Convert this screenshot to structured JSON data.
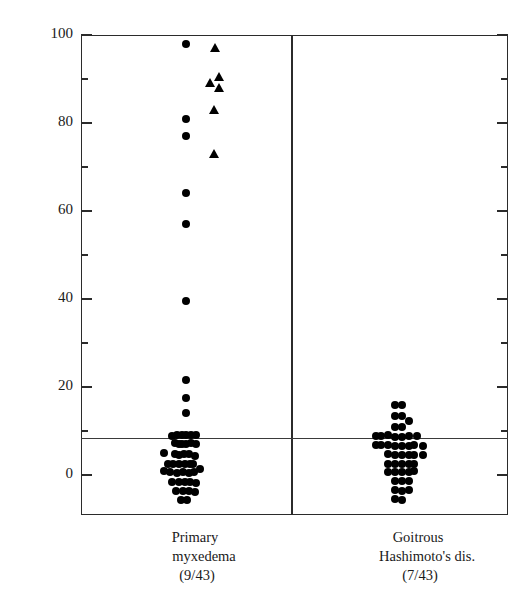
{
  "chart_data": {
    "type": "scatter",
    "title": "",
    "xlabel": "",
    "ylabel_parts": {
      "pre": "Inhibition of ",
      "sup": "125",
      "post": "I-TSH binding(%)"
    },
    "ylabel": "Inhibition of 125I-TSH binding(%)",
    "ylim": [
      -10,
      100
    ],
    "yticks_major": [
      0,
      20,
      40,
      60,
      80,
      100
    ],
    "yticks_minor": [
      10,
      30,
      50,
      70,
      90
    ],
    "ytick_labels": [
      "0",
      "20",
      "40",
      "60",
      "80",
      "100"
    ],
    "grid": false,
    "legend": "none",
    "cutoff_value": 8.5,
    "cutoff_note": "horizontal reference line near 8.5%",
    "groups": [
      {
        "name": "Primary myxedema",
        "caption_line1": "Primary",
        "caption_line2": "myxedema",
        "caption_line3": "(9/43)",
        "positive_fraction": "9/43",
        "series": [
          {
            "marker": "circle",
            "name": "primary-myxedema-circles",
            "points": [
              {
                "x": 0.0,
                "y": 98.0
              },
              {
                "x": 0.0,
                "y": 81.0
              },
              {
                "x": 0.0,
                "y": 77.0
              },
              {
                "x": 0.0,
                "y": 64.0
              },
              {
                "x": 0.0,
                "y": 57.0
              },
              {
                "x": 0.0,
                "y": 39.5
              },
              {
                "x": 0.0,
                "y": 21.5
              },
              {
                "x": 0.0,
                "y": 17.5
              },
              {
                "x": 0.0,
                "y": 14.0
              },
              {
                "x": -0.4,
                "y": 9.0
              },
              {
                "x": -0.62,
                "y": 8.8
              },
              {
                "x": -0.18,
                "y": 9.0
              },
              {
                "x": 0.0,
                "y": 9.2
              },
              {
                "x": 0.22,
                "y": 9.0
              },
              {
                "x": 0.46,
                "y": 9.0
              },
              {
                "x": -0.5,
                "y": 7.2
              },
              {
                "x": -0.3,
                "y": 7.0
              },
              {
                "x": -0.18,
                "y": 7.0
              },
              {
                "x": 0.0,
                "y": 7.0
              },
              {
                "x": 0.22,
                "y": 7.2
              },
              {
                "x": 0.46,
                "y": 7.0
              },
              {
                "x": -0.98,
                "y": 5.0
              },
              {
                "x": -0.52,
                "y": 4.8
              },
              {
                "x": -0.3,
                "y": 4.6
              },
              {
                "x": -0.1,
                "y": 4.8
              },
              {
                "x": 0.13,
                "y": 4.8
              },
              {
                "x": 0.4,
                "y": 4.4
              },
              {
                "x": -0.8,
                "y": 2.5
              },
              {
                "x": -0.58,
                "y": 2.6
              },
              {
                "x": -0.3,
                "y": 2.4
              },
              {
                "x": -0.06,
                "y": 2.5
              },
              {
                "x": 0.18,
                "y": 2.4
              },
              {
                "x": 0.34,
                "y": 2.4
              },
              {
                "x": -0.98,
                "y": 0.8
              },
              {
                "x": -0.72,
                "y": 0.6
              },
              {
                "x": -0.4,
                "y": 0.5
              },
              {
                "x": -0.14,
                "y": 0.6
              },
              {
                "x": 0.12,
                "y": 0.5
              },
              {
                "x": 0.38,
                "y": 0.6
              },
              {
                "x": 0.62,
                "y": 1.4
              },
              {
                "x": -0.62,
                "y": -1.6
              },
              {
                "x": -0.3,
                "y": -1.6
              },
              {
                "x": -0.06,
                "y": -1.6
              },
              {
                "x": 0.18,
                "y": -1.6
              },
              {
                "x": 0.44,
                "y": -1.8
              },
              {
                "x": -0.44,
                "y": -3.6
              },
              {
                "x": -0.12,
                "y": -3.6
              },
              {
                "x": 0.14,
                "y": -3.6
              },
              {
                "x": 0.4,
                "y": -3.8
              },
              {
                "x": -0.22,
                "y": -5.6
              },
              {
                "x": 0.06,
                "y": -5.6
              }
            ]
          },
          {
            "marker": "triangle",
            "name": "primary-myxedema-triangles",
            "points": [
              {
                "x": 1.3,
                "y": 97.0
              },
              {
                "x": 1.52,
                "y": 90.5
              },
              {
                "x": 1.08,
                "y": 89.0
              },
              {
                "x": 1.5,
                "y": 88.0
              },
              {
                "x": 1.28,
                "y": 83.0
              },
              {
                "x": 1.26,
                "y": 73.0
              }
            ]
          }
        ]
      },
      {
        "name": "Goitrous Hashimoto's dis.",
        "caption_line1": "Goitrous",
        "caption_line2": "Hashimoto's dis.",
        "caption_line3": "(7/43)",
        "positive_fraction": "7/43",
        "series": [
          {
            "marker": "circle",
            "name": "goitrous-hashimoto-circles",
            "points": [
              {
                "x": -0.12,
                "y": 16.0
              },
              {
                "x": 0.18,
                "y": 16.0
              },
              {
                "x": -0.12,
                "y": 13.4
              },
              {
                "x": 0.18,
                "y": 13.4
              },
              {
                "x": 0.48,
                "y": 12.2
              },
              {
                "x": -0.12,
                "y": 10.8
              },
              {
                "x": 0.18,
                "y": 10.8
              },
              {
                "x": -1.02,
                "y": 8.8
              },
              {
                "x": -0.78,
                "y": 8.8
              },
              {
                "x": -0.44,
                "y": 9.0
              },
              {
                "x": -0.12,
                "y": 8.6
              },
              {
                "x": 0.18,
                "y": 8.6
              },
              {
                "x": 0.48,
                "y": 8.8
              },
              {
                "x": 0.86,
                "y": 8.8
              },
              {
                "x": -1.02,
                "y": 6.8
              },
              {
                "x": -0.78,
                "y": 6.8
              },
              {
                "x": -0.44,
                "y": 6.8
              },
              {
                "x": -0.12,
                "y": 6.6
              },
              {
                "x": 0.18,
                "y": 6.6
              },
              {
                "x": 0.48,
                "y": 6.6
              },
              {
                "x": 0.72,
                "y": 6.8
              },
              {
                "x": 1.12,
                "y": 6.6
              },
              {
                "x": -0.44,
                "y": 4.8
              },
              {
                "x": -0.12,
                "y": 4.6
              },
              {
                "x": 0.18,
                "y": 4.6
              },
              {
                "x": 0.48,
                "y": 4.6
              },
              {
                "x": 0.72,
                "y": 4.6
              },
              {
                "x": 1.12,
                "y": 4.6
              },
              {
                "x": -0.44,
                "y": 2.6
              },
              {
                "x": -0.12,
                "y": 2.6
              },
              {
                "x": 0.18,
                "y": 2.6
              },
              {
                "x": 0.48,
                "y": 2.6
              },
              {
                "x": 0.72,
                "y": 2.6
              },
              {
                "x": -0.44,
                "y": 0.6
              },
              {
                "x": -0.12,
                "y": 0.6
              },
              {
                "x": 0.18,
                "y": 0.6
              },
              {
                "x": 0.48,
                "y": 0.6
              },
              {
                "x": 0.72,
                "y": 0.8
              },
              {
                "x": -0.12,
                "y": -1.4
              },
              {
                "x": 0.18,
                "y": -1.4
              },
              {
                "x": 0.48,
                "y": -1.4
              },
              {
                "x": -0.12,
                "y": -3.4
              },
              {
                "x": 0.18,
                "y": -3.6
              },
              {
                "x": 0.48,
                "y": -3.4
              },
              {
                "x": -0.12,
                "y": -5.4
              },
              {
                "x": 0.18,
                "y": -5.6
              }
            ]
          }
        ]
      }
    ]
  }
}
